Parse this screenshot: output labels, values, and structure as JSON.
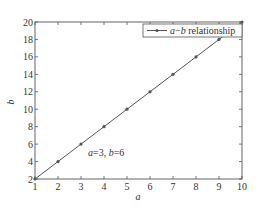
{
  "chart_data": {
    "type": "line",
    "title": "",
    "xlabel": "a",
    "ylabel": "b",
    "xlim": [
      1,
      10
    ],
    "ylim": [
      2,
      20
    ],
    "xticks": [
      1,
      2,
      3,
      4,
      5,
      6,
      7,
      8,
      9,
      10
    ],
    "yticks": [
      2,
      4,
      6,
      8,
      10,
      12,
      14,
      16,
      18,
      20
    ],
    "grid": false,
    "legend_position": "upper right",
    "series": [
      {
        "name": "a−b relationship",
        "x": [
          1,
          2,
          3,
          4,
          5,
          6,
          7,
          8,
          9,
          10
        ],
        "values": [
          2,
          4,
          6,
          8,
          10,
          12,
          14,
          16,
          18,
          20
        ],
        "marker": "dot",
        "color": "#555555"
      }
    ],
    "annotations": [
      {
        "text_a": "a",
        "text_mid": "=3, ",
        "text_b": "b",
        "text_end": "=6",
        "x": 3,
        "y": 6
      }
    ]
  },
  "legend": {
    "label_a": "a",
    "label_dash": "−",
    "label_b": "b",
    "label_rest": " relationship"
  },
  "axes": {
    "xlabel": "a",
    "ylabel": "b"
  },
  "annotation": {
    "a": "a",
    "mid": "=3, ",
    "b": "b",
    "end": "=6"
  }
}
